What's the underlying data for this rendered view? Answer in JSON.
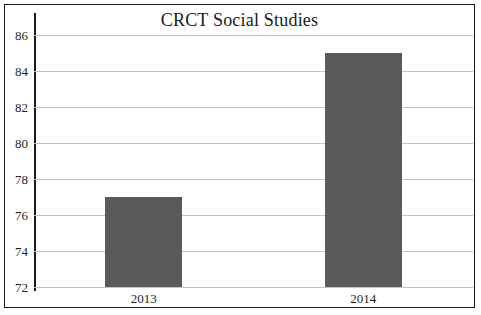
{
  "chart_data": {
    "type": "bar",
    "title": "CRCT Social Studies",
    "xlabel": "",
    "ylabel": "",
    "categories": [
      "2013",
      "2014"
    ],
    "values": [
      77,
      85
    ],
    "series": [
      {
        "name": "CRCT Social Studies",
        "values": [
          77,
          85
        ]
      }
    ],
    "ylim": [
      72,
      86
    ],
    "yticks": [
      72,
      74,
      76,
      78,
      80,
      82,
      84,
      86
    ],
    "ytick_labels": [
      "72",
      "74",
      "76",
      "78",
      "80",
      "82",
      "84",
      "86"
    ],
    "grid": true,
    "legend": false,
    "bar_color": "#5a5a5a",
    "gridline_color": "#c4c4c4",
    "axis_color": "#1c1c1c",
    "frame_color": "#1c1c1c",
    "background_color": "#ffffff"
  }
}
